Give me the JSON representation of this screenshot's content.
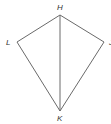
{
  "diagram": {
    "type": "kite",
    "colors": {
      "stroke": "#6a6a6a",
      "label": "#333333",
      "background": "#ffffff"
    },
    "vertices": {
      "H": {
        "label": "H",
        "x": 60,
        "y": 15
      },
      "L": {
        "label": "L",
        "x": 17,
        "y": 42
      },
      "J": {
        "label": "J",
        "x": 104,
        "y": 42
      },
      "K": {
        "label": "K",
        "x": 60,
        "y": 111
      }
    },
    "segments": [
      "HL",
      "HJ",
      "LK",
      "JK",
      "HK"
    ]
  }
}
